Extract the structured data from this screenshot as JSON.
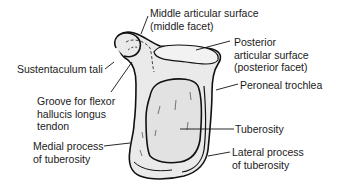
{
  "diagram": {
    "colors": {
      "bone_fill": "#eaeaea",
      "outline": "#111111",
      "text": "#1a1a1a",
      "background": "#ffffff"
    },
    "labels": {
      "middle_articular_line1": "Middle articular surface",
      "middle_articular_line2": "(middle facet)",
      "posterior_articular_line1": "Posterior",
      "posterior_articular_line2": "articular surface",
      "posterior_articular_line3": "(posterior facet)",
      "sustentaculum": "Sustentaculum tali",
      "peroneal_trochlea": "Peroneal trochlea",
      "groove_line1": "Groove for flexor",
      "groove_line2": "hallucis longus",
      "groove_line3": "tendon",
      "tuberosity": "Tuberosity",
      "medial_process_line1": "Medial process",
      "medial_process_line2": "of tuberosity",
      "lateral_process_line1": "Lateral process",
      "lateral_process_line2": "of tuberosity"
    }
  }
}
